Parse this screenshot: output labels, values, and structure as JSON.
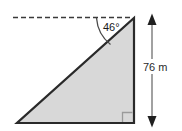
{
  "figure": {
    "type": "geometry-diagram",
    "shape": "right-triangle",
    "background_color": "#ffffff",
    "fill_color": "#d8d8d8",
    "outline_color": "#2a2a2a",
    "dashed_line_color": "#3a3a3a",
    "dimension_line_color": "#8a8a8a",
    "angle_label": "46°",
    "dimension_label": "76 m",
    "right_angle_marker": "right-angle-square",
    "angle_value": 46,
    "angle_unit": "degrees",
    "height_value": 76,
    "height_unit": "m"
  }
}
